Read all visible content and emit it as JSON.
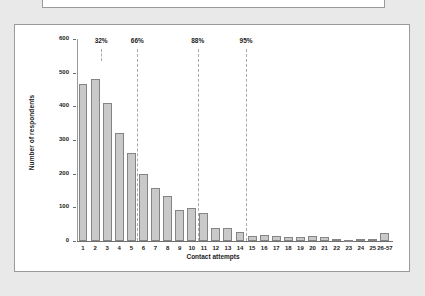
{
  "page": {
    "background_color": "#e9e9e9",
    "panel_color": "#ffffff",
    "panel_border_color": "#9b9b9b"
  },
  "top_panel": {
    "name": "upper-cropped-panel",
    "content": ""
  },
  "chart_data": {
    "type": "bar",
    "title": "",
    "xlabel": "Contact attempts",
    "ylabel": "Number of respondents",
    "ylim": [
      0,
      600
    ],
    "yticks": [
      0,
      100,
      200,
      300,
      400,
      500,
      600
    ],
    "grid": false,
    "legend": null,
    "bar_fill_color": "#c9c9c9",
    "bar_border_color": "#848484",
    "annotation_line_color": "#a9a9a9",
    "categories": [
      "1",
      "2",
      "3",
      "4",
      "5",
      "6",
      "7",
      "8",
      "9",
      "10",
      "11",
      "12",
      "13",
      "14",
      "15",
      "16",
      "17",
      "18",
      "19",
      "20",
      "21",
      "22",
      "23",
      "24",
      "25",
      "26-57"
    ],
    "values": [
      465,
      482,
      411,
      322,
      262,
      200,
      157,
      133,
      91,
      99,
      83,
      38,
      38,
      27,
      16,
      19,
      15,
      12,
      12,
      14,
      11,
      6,
      2,
      5,
      7,
      24
    ],
    "annotations": [
      {
        "label": "32%",
        "after_category": "2",
        "cumulative_percent": 32
      },
      {
        "label": "66%",
        "after_category": "5",
        "cumulative_percent": 66
      },
      {
        "label": "88%",
        "after_category": "10",
        "cumulative_percent": 88
      },
      {
        "label": "95%",
        "after_category": "14",
        "cumulative_percent": 95
      }
    ]
  }
}
